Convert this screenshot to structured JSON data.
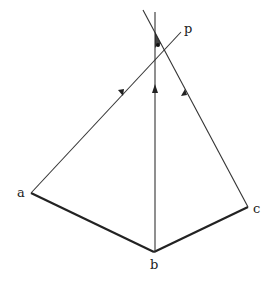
{
  "diagram": {
    "type": "geometric-ray-diagram",
    "colors": {
      "line": "#222222",
      "background": "#ffffff"
    },
    "points": {
      "a": {
        "label": "a",
        "x": 31,
        "y": 193
      },
      "b": {
        "label": "b",
        "x": 154,
        "y": 252
      },
      "c": {
        "label": "c",
        "x": 248,
        "y": 207
      },
      "p": {
        "label": "p",
        "x": 180,
        "y": 33
      }
    },
    "segments": [
      {
        "from": "a",
        "to": "b",
        "style": "thick"
      },
      {
        "from": "b",
        "to": "c",
        "style": "thick"
      },
      {
        "from": "a",
        "to": "p",
        "style": "thin",
        "arrow": "toward-p"
      },
      {
        "from": "b",
        "to": "top",
        "style": "thin",
        "arrow": "up"
      },
      {
        "from": "c",
        "to": "top-left",
        "style": "thin",
        "arrow": "up"
      }
    ],
    "labels": {
      "a": "a",
      "b": "b",
      "c": "c",
      "p": "p"
    }
  }
}
